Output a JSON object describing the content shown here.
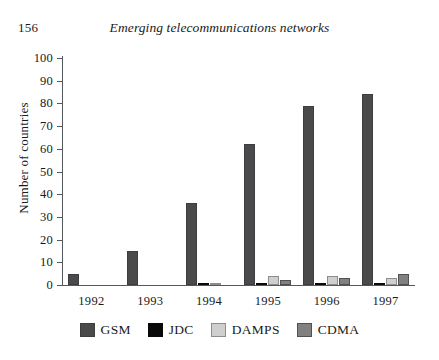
{
  "page": {
    "number": "156",
    "running_title": "Emerging telecommunications networks"
  },
  "chart_data": {
    "type": "bar",
    "title": "",
    "xlabel": "",
    "ylabel": "Number of countries",
    "ylim": [
      0,
      100
    ],
    "ytick_step": 10,
    "yticks": [
      "0",
      "10",
      "20",
      "30",
      "40",
      "50",
      "60",
      "70",
      "80",
      "90",
      "100"
    ],
    "grid": false,
    "legend_position": "bottom",
    "categories": [
      "1992",
      "1993",
      "1994",
      "1995",
      "1996",
      "1997"
    ],
    "series": [
      {
        "name": "GSM",
        "color": "#4a4a4a",
        "values": [
          5,
          15,
          36,
          62,
          79,
          84
        ]
      },
      {
        "name": "JDC",
        "color": "#090909",
        "values": [
          0,
          0,
          1,
          1,
          1,
          1
        ]
      },
      {
        "name": "DAMPS",
        "color": "#cfcfcf",
        "values": [
          0,
          0,
          1,
          4,
          4,
          3
        ]
      },
      {
        "name": "CDMA",
        "color": "#818181",
        "values": [
          0,
          0,
          0,
          2,
          3,
          5
        ]
      }
    ]
  },
  "legend": {
    "items": [
      {
        "label": "GSM",
        "swatch": "legend-swatch-gsm"
      },
      {
        "label": "JDC",
        "swatch": "legend-swatch-jdc"
      },
      {
        "label": "DAMPS",
        "swatch": "legend-swatch-damps"
      },
      {
        "label": "CDMA",
        "swatch": "legend-swatch-cdma"
      }
    ]
  }
}
